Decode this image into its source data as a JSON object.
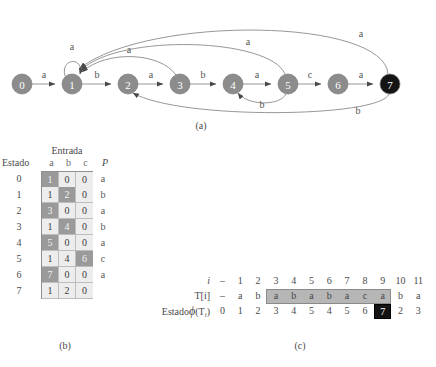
{
  "figure": {
    "caption_a": "(a)",
    "caption_b": "(b)",
    "caption_c": "(c)"
  },
  "colors": {
    "node_fill": "#8c8c8c",
    "node_accept_fill": "#141414",
    "edge_stroke": "#8b8b8b",
    "cell_light": "#ededed",
    "cell_shaded": "#9a9a9a",
    "highlight": "#b6b6b6",
    "black_cell": "#141414"
  },
  "graph": {
    "nodes": [
      {
        "id": "0",
        "label": "0",
        "cx": 22,
        "cy": 84,
        "r": 10,
        "accepting": false
      },
      {
        "id": "1",
        "label": "1",
        "cx": 72,
        "cy": 84,
        "r": 10,
        "accepting": false
      },
      {
        "id": "2",
        "label": "2",
        "cx": 128,
        "cy": 84,
        "r": 10,
        "accepting": false
      },
      {
        "id": "3",
        "label": "3",
        "cx": 180,
        "cy": 84,
        "r": 10,
        "accepting": false
      },
      {
        "id": "4",
        "label": "4",
        "cx": 233,
        "cy": 84,
        "r": 10,
        "accepting": false
      },
      {
        "id": "5",
        "label": "5",
        "cx": 288,
        "cy": 84,
        "r": 10,
        "accepting": false
      },
      {
        "id": "6",
        "label": "6",
        "cx": 338,
        "cy": 84,
        "r": 10,
        "accepting": false
      },
      {
        "id": "7",
        "label": "7",
        "cx": 390,
        "cy": 84,
        "r": 10,
        "accepting": true
      }
    ],
    "edges": [
      {
        "from": "0",
        "to": "1",
        "label": "a",
        "kind": "straight"
      },
      {
        "from": "1",
        "to": "1",
        "label": "a",
        "kind": "self-loop"
      },
      {
        "from": "1",
        "to": "2",
        "label": "b",
        "kind": "straight"
      },
      {
        "from": "2",
        "to": "3",
        "label": "a",
        "kind": "straight"
      },
      {
        "from": "3",
        "to": "4",
        "label": "b",
        "kind": "straight"
      },
      {
        "from": "4",
        "to": "5",
        "label": "a",
        "kind": "straight"
      },
      {
        "from": "5",
        "to": "6",
        "label": "c",
        "kind": "straight"
      },
      {
        "from": "6",
        "to": "7",
        "label": "a",
        "kind": "straight"
      },
      {
        "from": "3",
        "to": "1",
        "label": "a",
        "kind": "arc-above"
      },
      {
        "from": "5",
        "to": "1",
        "label": "a",
        "kind": "arc-above"
      },
      {
        "from": "7",
        "to": "1",
        "label": "a",
        "kind": "arc-above"
      },
      {
        "from": "5",
        "to": "4",
        "label": "b",
        "kind": "arc-below"
      },
      {
        "from": "7",
        "to": "2",
        "label": "b",
        "kind": "arc-below"
      }
    ]
  },
  "table_b": {
    "group_header": "Entrada",
    "state_header": "Estado",
    "input_headers": [
      "a",
      "b",
      "c"
    ],
    "p_header": "P",
    "rows": [
      {
        "state": "0",
        "cells": [
          "1",
          "0",
          "0"
        ],
        "shaded": [
          true,
          false,
          false
        ],
        "p": "a"
      },
      {
        "state": "1",
        "cells": [
          "1",
          "2",
          "0"
        ],
        "shaded": [
          false,
          true,
          false
        ],
        "p": "b"
      },
      {
        "state": "2",
        "cells": [
          "3",
          "0",
          "0"
        ],
        "shaded": [
          true,
          false,
          false
        ],
        "p": "a"
      },
      {
        "state": "3",
        "cells": [
          "1",
          "4",
          "0"
        ],
        "shaded": [
          false,
          true,
          false
        ],
        "p": "b"
      },
      {
        "state": "4",
        "cells": [
          "5",
          "0",
          "0"
        ],
        "shaded": [
          true,
          false,
          false
        ],
        "p": "a"
      },
      {
        "state": "5",
        "cells": [
          "1",
          "4",
          "6"
        ],
        "shaded": [
          false,
          false,
          true
        ],
        "p": "c"
      },
      {
        "state": "6",
        "cells": [
          "7",
          "0",
          "0"
        ],
        "shaded": [
          true,
          false,
          false
        ],
        "p": "a"
      },
      {
        "state": "7",
        "cells": [
          "1",
          "2",
          "0"
        ],
        "shaded": [
          false,
          false,
          false
        ],
        "p": ""
      }
    ]
  },
  "trace_c": {
    "row_labels": {
      "i": "i",
      "t": "T[i]",
      "state_prefix": "Estado",
      "state_phi": "ϕ",
      "state_arg_open": "(T",
      "state_arg_sub": "i",
      "state_arg_close": ")"
    },
    "i": [
      "–",
      "1",
      "2",
      "3",
      "4",
      "5",
      "6",
      "7",
      "8",
      "9",
      "10",
      "11"
    ],
    "t": [
      "–",
      "a",
      "b",
      "a",
      "b",
      "a",
      "b",
      "a",
      "c",
      "a",
      "b",
      "a"
    ],
    "state": [
      "0",
      "1",
      "2",
      "3",
      "4",
      "5",
      "4",
      "5",
      "6",
      "7",
      "2",
      "3"
    ],
    "highlight_from_index": 3,
    "highlight_to_index": 9,
    "accept_index": 9,
    "accept_value": "7"
  }
}
